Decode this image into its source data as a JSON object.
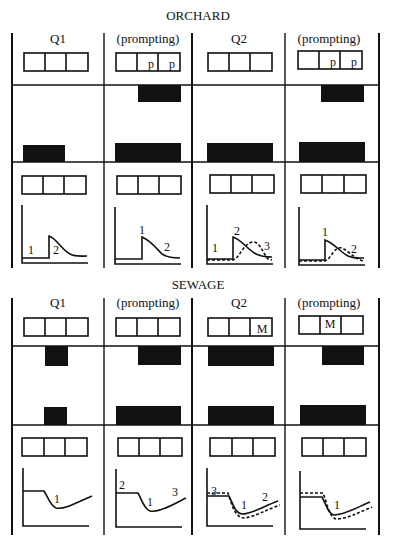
{
  "sections": [
    {
      "title": "ORCHARD",
      "columns": [
        {
          "label": "Q1",
          "cells_top": [
            "",
            "",
            ""
          ],
          "cells_bottom": [
            "",
            "",
            ""
          ],
          "curve_labels": [
            "1",
            "2"
          ]
        },
        {
          "label": "(prompting)",
          "cells_top": [
            "",
            "p",
            "p"
          ],
          "cells_bottom": [
            "",
            "",
            ""
          ],
          "curve_labels": [
            "1",
            "2"
          ]
        },
        {
          "label": "Q2",
          "cells_top": [
            "",
            "",
            ""
          ],
          "cells_bottom": [
            "",
            "",
            ""
          ],
          "curve_labels": [
            "1",
            "2",
            "3"
          ]
        },
        {
          "label": "(prompting)",
          "cells_top": [
            "",
            "p",
            "p"
          ],
          "cells_bottom": [
            "",
            "",
            ""
          ],
          "curve_labels": [
            "1",
            "2"
          ]
        }
      ]
    },
    {
      "title": "SEWAGE",
      "columns": [
        {
          "label": "Q1",
          "cells_top": [
            "",
            "",
            ""
          ],
          "cells_bottom": [
            "",
            "",
            ""
          ],
          "curve_labels": [
            "1"
          ]
        },
        {
          "label": "(prompting)",
          "cells_top": [
            "",
            "",
            ""
          ],
          "cells_bottom": [
            "",
            "",
            ""
          ],
          "curve_labels": [
            "2",
            "1",
            "3"
          ]
        },
        {
          "label": "Q2",
          "cells_top": [
            "",
            "",
            "M"
          ],
          "cells_bottom": [
            "",
            "",
            ""
          ],
          "curve_labels": [
            "3",
            "1",
            "2"
          ]
        },
        {
          "label": "(prompting)",
          "cells_top": [
            "",
            "M",
            ""
          ],
          "cells_bottom": [
            "",
            "",
            ""
          ],
          "curve_labels": [
            "1"
          ]
        }
      ]
    }
  ],
  "colors": {
    "ink": "#111111",
    "background": "#ffffff"
  }
}
